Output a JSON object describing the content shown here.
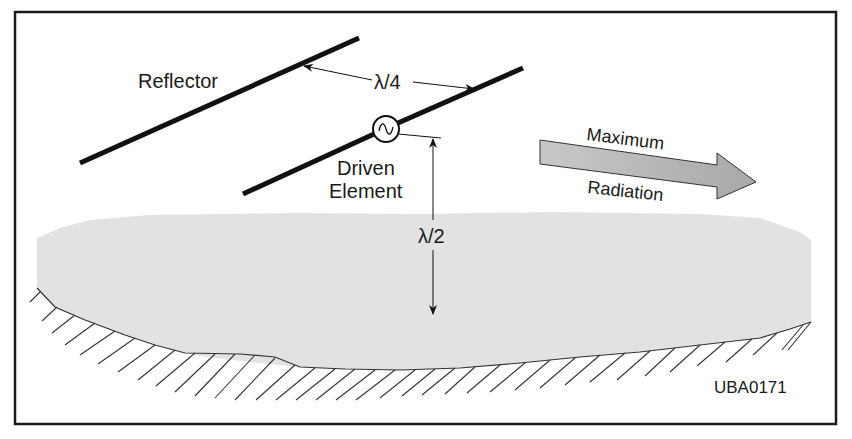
{
  "diagram": {
    "labels": {
      "reflector": "Reflector",
      "quarter_wave": "λ/4",
      "driven_line1": "Driven",
      "driven_line2": "Element",
      "half_wave": "λ/2",
      "max_line1": "Maximum",
      "max_line2": "Radiation",
      "figure_id": "UBA0171"
    },
    "colors": {
      "line": "#111111",
      "ground_fill": "#e2e2e2",
      "arrow_fill": "#bdbdbd",
      "arrow_stroke": "#333333",
      "frame": "#1a1a1a",
      "background": "#ffffff"
    }
  }
}
